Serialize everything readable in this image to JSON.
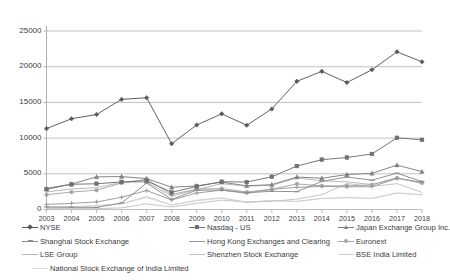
{
  "chart_data": {
    "type": "line",
    "title": "",
    "xlabel": "",
    "ylabel": "",
    "x": [
      2003,
      2004,
      2005,
      2006,
      2007,
      2008,
      2009,
      2010,
      2011,
      2012,
      2013,
      2014,
      2015,
      2016,
      2017,
      2018
    ],
    "categories": [
      "2003",
      "2004",
      "2005",
      "2006",
      "2007",
      "2008",
      "2009",
      "2010",
      "2011",
      "2012",
      "2013",
      "2014",
      "2015",
      "2016",
      "2017",
      "2018"
    ],
    "ylim": [
      0,
      25000
    ],
    "yticks": [
      0,
      5000,
      10000,
      15000,
      20000,
      25000
    ],
    "ytick_labels": [
      "0",
      "5000",
      "10000",
      "15000",
      "20000",
      "25000"
    ],
    "grid": true,
    "legend_position": "bottom",
    "series": [
      {
        "name": "NYSE",
        "color": "#595959",
        "marker": "diamond",
        "values": [
          11329,
          12708,
          13310,
          15421,
          15650,
          9209,
          11838,
          13394,
          11796,
          14086,
          17950,
          19351,
          17787,
          19573,
          22081,
          20679
        ]
      },
      {
        "name": "Nasdaq - US",
        "color": "#707070",
        "marker": "square",
        "values": [
          2844,
          3533,
          3604,
          3865,
          4014,
          2396,
          3239,
          3889,
          3845,
          4582,
          6085,
          6979,
          7281,
          7779,
          10039,
          9757
        ]
      },
      {
        "name": "Japan Exchange Group Inc.",
        "color": "#808080",
        "marker": "triangle",
        "values": [
          2953,
          3558,
          4573,
          4614,
          4331,
          3116,
          3306,
          3828,
          3325,
          3479,
          4543,
          4378,
          4895,
          5062,
          6222,
          5297
        ]
      },
      {
        "name": "Shanghai Stock Exchange",
        "color": "#8c8c8c",
        "marker": "dash",
        "values": [
          360,
          314,
          286,
          918,
          3694,
          1425,
          2705,
          2716,
          2357,
          2547,
          2497,
          3933,
          4549,
          4104,
          5084,
          3919
        ]
      },
      {
        "name": "Hong Kong Exchanges and Clearing",
        "color": "#999999",
        "marker": "cross",
        "values": [
          714,
          861,
          1055,
          1715,
          2654,
          1329,
          2305,
          2711,
          2258,
          2832,
          3101,
          3233,
          3185,
          3193,
          4351,
          3819
        ]
      },
      {
        "name": "Euronext",
        "color": "#a6a6a6",
        "marker": "circle",
        "values": [
          2076,
          2441,
          2707,
          3713,
          4223,
          2102,
          2869,
          2930,
          2447,
          2832,
          3584,
          3319,
          3306,
          3464,
          4393,
          3730
        ]
      },
      {
        "name": "LSE Group",
        "color": "#b5b5b5",
        "marker": "none",
        "values": [
          2460,
          2865,
          3058,
          3794,
          3852,
          1868,
          2796,
          3613,
          3266,
          3397,
          4429,
          4013,
          3879,
          3496,
          4456,
          3638
        ]
      },
      {
        "name": "Shenzhen Stock Exchange",
        "color": "#c2c2c2",
        "marker": "none",
        "values": [
          153,
          164,
          116,
          228,
          784,
          353,
          868,
          1311,
          1055,
          1150,
          1452,
          2072,
          3639,
          3217,
          3622,
          2405
        ]
      },
      {
        "name": "BSE India Limited",
        "color": "#cfcfcf",
        "marker": "none",
        "values": [
          279,
          387,
          553,
          818,
          1819,
          647,
          1306,
          1631,
          1007,
          1263,
          1138,
          1558,
          1681,
          1566,
          2331,
          2083
        ]
      },
      {
        "name": "National Stock Exchange of India Limited",
        "color": "#dadada",
        "marker": "none",
        "values": [
          252,
          363,
          516,
          774,
          1660,
          600,
          1224,
          1596,
          985,
          1234,
          1112,
          1521,
          1642,
          1534,
          2274,
          2056
        ]
      }
    ]
  },
  "legend": {
    "rows": [
      [
        {
          "label": "NYSE",
          "color": "#595959",
          "marker": "diamond"
        },
        {
          "label": "Nasdaq - US",
          "color": "#707070",
          "marker": "square"
        },
        {
          "label": "Japan Exchange Group Inc.",
          "color": "#808080",
          "marker": "triangle"
        }
      ],
      [
        {
          "label": "Shanghai Stock Exchange",
          "color": "#8c8c8c",
          "marker": "dash"
        },
        {
          "label": "Hong Kong Exchanges and Clearing",
          "color": "#999999",
          "marker": "cross"
        },
        {
          "label": "Euronext",
          "color": "#a6a6a6",
          "marker": "circle"
        }
      ],
      [
        {
          "label": "LSE Group",
          "color": "#b5b5b5",
          "marker": "none"
        },
        {
          "label": "Shenzhen Stock Exchange",
          "color": "#c2c2c2",
          "marker": "none"
        },
        {
          "label": "BSE India Limited",
          "color": "#cfcfcf",
          "marker": "none"
        }
      ],
      [
        {
          "label": "National Stock Exchange of India Limited",
          "color": "#dadada",
          "marker": "none"
        }
      ]
    ]
  },
  "axes": {
    "grid_color": "#a6a6a6",
    "axis_color": "#9e9e9e"
  }
}
